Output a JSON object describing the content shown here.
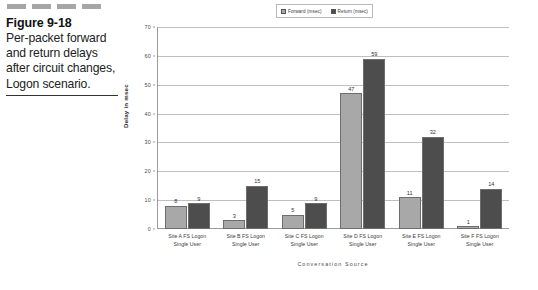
{
  "figure": {
    "title": "Figure 9-18",
    "caption": "Per-packet forward and return delays after circuit changes, Logon scenario.",
    "caption_lines": [
      "Per-packet forward",
      "and return delays",
      "after circuit changes,",
      "Logon scenario."
    ]
  },
  "legend": {
    "position": "top-center",
    "entries": [
      {
        "label": "Forward (msec)",
        "color": "#a8a8a8"
      },
      {
        "label": "Return (msec)",
        "color": "#4d4d4d"
      }
    ]
  },
  "axes": {
    "y_title": "Delay in msec",
    "x_title": "Conversation Source",
    "y_ticks": [
      "0",
      "10",
      "20",
      "30",
      "40",
      "50",
      "60",
      "70"
    ]
  },
  "chart_data": {
    "type": "bar",
    "xlabel": "Conversation Source",
    "ylabel": "Delay in msec",
    "ylim": [
      0,
      70
    ],
    "ytick_step": 10,
    "grid": true,
    "legend_position": "top-center",
    "categories": [
      "Site A FS Logon Single User",
      "Site B FS Logon Single User",
      "Site C FS Logon Single User",
      "Site D FS Logon Single User",
      "Site E FS Logon Single User",
      "Site F FS Logon Single User"
    ],
    "category_lines": [
      [
        "Site A FS Logon",
        "Single User"
      ],
      [
        "Site B FS Logon",
        "Single User"
      ],
      [
        "Site C FS Logon",
        "Single User"
      ],
      [
        "Site D FS Logon",
        "Single User"
      ],
      [
        "Site E FS Logon",
        "Single User"
      ],
      [
        "Site F FS Logon",
        "Single User"
      ]
    ],
    "series": [
      {
        "name": "Forward (msec)",
        "color": "#a8a8a8",
        "values": [
          8,
          3,
          5,
          47,
          11,
          1
        ]
      },
      {
        "name": "Return (msec)",
        "color": "#4d4d4d",
        "values": [
          9,
          15,
          9,
          59,
          32,
          14
        ]
      }
    ]
  }
}
